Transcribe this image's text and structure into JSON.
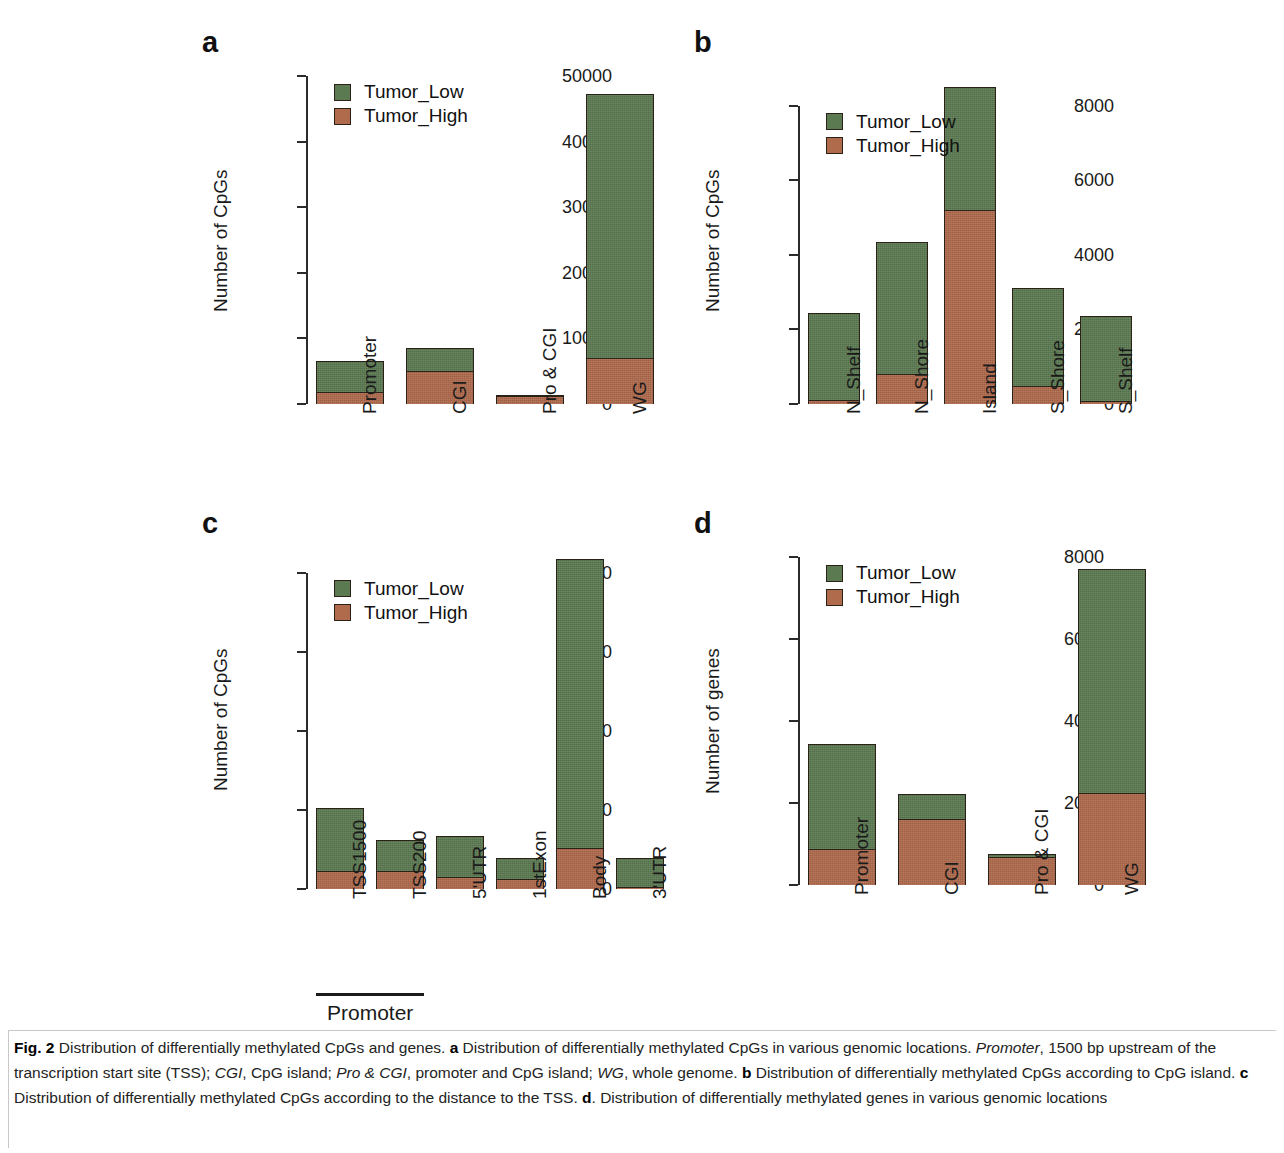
{
  "figure": {
    "label": "Fig. 2",
    "caption_parts": [
      {
        "t": "Distribution of differentially methylated CpGs and genes. ",
        "s": "normal"
      },
      {
        "t": "a",
        "s": "bold"
      },
      {
        "t": " Distribution of differentially methylated CpGs in various genomic locations. ",
        "s": "normal"
      },
      {
        "t": "Promoter",
        "s": "italic"
      },
      {
        "t": ", 1500 bp upstream of the transcription start site (TSS); ",
        "s": "normal"
      },
      {
        "t": "CGI",
        "s": "italic"
      },
      {
        "t": ", CpG island; ",
        "s": "normal"
      },
      {
        "t": "Pro & CGI",
        "s": "italic"
      },
      {
        "t": ", promoter and CpG island; ",
        "s": "normal"
      },
      {
        "t": "WG",
        "s": "italic"
      },
      {
        "t": ", whole genome. ",
        "s": "normal"
      },
      {
        "t": "b",
        "s": "bold"
      },
      {
        "t": " Distribution of differentially methylated CpGs according to CpG island. ",
        "s": "normal"
      },
      {
        "t": "c",
        "s": "bold"
      },
      {
        "t": " Distribution of differentially methylated CpGs according to the distance to the TSS. ",
        "s": "normal"
      },
      {
        "t": "d",
        "s": "bold"
      },
      {
        "t": ". Distribution of differentially methylated genes in various genomic locations",
        "s": "normal"
      }
    ]
  },
  "colors": {
    "tumor_low": "#5b7a52",
    "tumor_high": "#b06a4c",
    "axis": "#2b2b2b",
    "text": "#1a1a1a"
  },
  "legend": {
    "entries": [
      {
        "label": "Tumor_Low",
        "color": "#5b7a52"
      },
      {
        "label": "Tumor_High",
        "color": "#b06a4c"
      }
    ]
  },
  "chart_data": [
    {
      "panel": "a",
      "type": "bar",
      "stacked": true,
      "title": "a",
      "xlabel": "",
      "ylabel": "Number of CpGs",
      "ylim": [
        0,
        50000
      ],
      "yticks": [
        0,
        10000,
        20000,
        30000,
        40000,
        50000
      ],
      "ytick_labels": [
        "0",
        "10000",
        "20000",
        "30000",
        "40000",
        "50000"
      ],
      "grid": false,
      "legend_position": "top-left",
      "categories": [
        "Promoter",
        "CGI",
        "Pro & CGI",
        "WG"
      ],
      "series": [
        {
          "name": "Tumor_High",
          "values": [
            1800,
            5100,
            1350,
            7100
          ]
        },
        {
          "name": "Tumor_Low",
          "values": [
            4800,
            3450,
            50,
            40100
          ]
        }
      ],
      "totals": [
        6600,
        8550,
        1400,
        47200
      ]
    },
    {
      "panel": "b",
      "type": "bar",
      "stacked": true,
      "title": "b",
      "xlabel": "",
      "ylabel": "Number of CpGs",
      "ylim": [
        0,
        8800
      ],
      "yticks": [
        0,
        2000,
        4000,
        6000,
        8000
      ],
      "ytick_labels": [
        "0",
        "2000",
        "4000",
        "6000",
        "8000"
      ],
      "grid": false,
      "legend_position": "top-left",
      "categories": [
        "N_Shelf",
        "N_Shore",
        "Island",
        "S_Shore",
        "S_Shelf"
      ],
      "series": [
        {
          "name": "Tumor_High",
          "values": [
            100,
            820,
            5230,
            480,
            80
          ]
        },
        {
          "name": "Tumor_Low",
          "values": [
            2330,
            3520,
            3270,
            2640,
            2270
          ]
        }
      ],
      "totals": [
        2430,
        4340,
        8500,
        3120,
        2350
      ]
    },
    {
      "panel": "c",
      "type": "bar",
      "stacked": true,
      "title": "c",
      "xlabel": "Promoter",
      "ylabel": "Number of CpGs",
      "ylim": [
        0,
        17200
      ],
      "yticks": [
        0,
        4000,
        8000,
        12000,
        16000
      ],
      "ytick_labels": [
        "0",
        "4000",
        "8000",
        "12000",
        "16000"
      ],
      "grid": false,
      "legend_position": "top-left",
      "categories": [
        "TSS1500",
        "TSS200",
        "5'UTR",
        "1stExon",
        "Body",
        "3'UTR"
      ],
      "series": [
        {
          "name": "Tumor_High",
          "values": [
            900,
            950,
            640,
            520,
            2080,
            110
          ]
        },
        {
          "name": "Tumor_Low",
          "values": [
            3220,
            1520,
            2020,
            1060,
            14620,
            1450
          ]
        }
      ],
      "totals": [
        4120,
        2470,
        2660,
        1580,
        16700,
        1560
      ],
      "bracket": {
        "label": "Promoter",
        "spans": [
          "TSS1500",
          "TSS200"
        ]
      }
    },
    {
      "panel": "d",
      "type": "bar",
      "stacked": true,
      "title": "d",
      "xlabel": "",
      "ylabel": "Number of genes",
      "ylim": [
        0,
        8000
      ],
      "yticks": [
        0,
        2000,
        4000,
        6000,
        8000
      ],
      "ytick_labels": [
        "0",
        "2000",
        "4000",
        "6000",
        "8000"
      ],
      "grid": false,
      "legend_position": "top-left",
      "categories": [
        "Promoter",
        "CGI",
        "Pro & CGI",
        "WG"
      ],
      "series": [
        {
          "name": "Tumor_High",
          "values": [
            880,
            1630,
            700,
            2250
          ]
        },
        {
          "name": "Tumor_Low",
          "values": [
            2570,
            590,
            50,
            5450
          ]
        }
      ],
      "totals": [
        3450,
        2220,
        750,
        7700
      ]
    }
  ]
}
